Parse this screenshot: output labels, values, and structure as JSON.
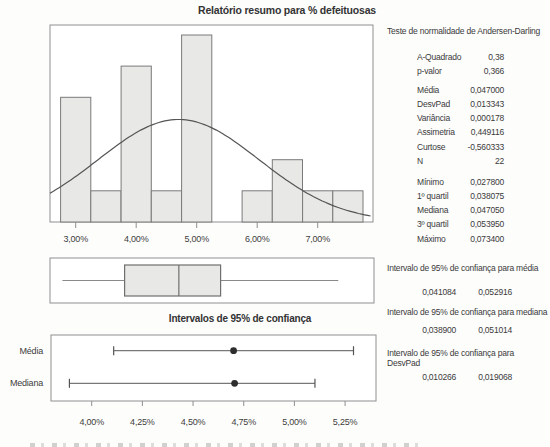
{
  "title": "Relatório resumo para % defeituosas",
  "colors": {
    "text": "#3b3b3b",
    "frame": "#8f8f8f",
    "bar_fill": "#e8e8e6",
    "bar_stroke": "#7a7a7a",
    "curve": "#555555",
    "box_fill": "#e8e8e6",
    "box_stroke": "#6f6f6f",
    "whisker": "#8a8a8a",
    "interval_line": "#777777",
    "interval_cap": "#555555",
    "point": "#2d2d2d"
  },
  "chart_data": [
    {
      "id": "histogram",
      "type": "bar",
      "title": "",
      "bins": [
        3.0,
        3.5,
        4.0,
        4.5,
        5.0,
        5.5,
        6.0,
        6.5,
        7.0,
        7.5
      ],
      "counts": [
        4,
        1,
        5,
        1,
        6,
        0,
        1,
        2,
        1,
        1
      ],
      "bin_width": 0.5,
      "x_ticks": [
        {
          "value": 3,
          "label": "3,00%"
        },
        {
          "value": 4,
          "label": "4,00%"
        },
        {
          "value": 5,
          "label": "5,00%"
        },
        {
          "value": 6,
          "label": "6,00%"
        },
        {
          "value": 7,
          "label": "7,00%"
        }
      ],
      "normal_overlay": {
        "mean": 4.7,
        "sd": 1.3343,
        "n": 22
      },
      "xlim": [
        2.575,
        7.91
      ],
      "ylim": [
        0,
        6.32
      ],
      "grid": false
    },
    {
      "id": "boxplot",
      "type": "boxplot",
      "min": 2.78,
      "q1": 3.8075,
      "median": 4.705,
      "q3": 5.395,
      "max": 7.34,
      "units": "percent"
    },
    {
      "id": "intervals",
      "type": "interval",
      "title": "Intervalos de 95% de confiança",
      "rows": [
        {
          "label": "Média",
          "low": 4.1084,
          "point": 4.7,
          "high": 5.2916
        },
        {
          "label": "Mediana",
          "low": 3.89,
          "point": 4.705,
          "high": 5.1014
        }
      ],
      "x_ticks": [
        {
          "value": 4.0,
          "label": "4,00%"
        },
        {
          "value": 4.25,
          "label": "4,25%"
        },
        {
          "value": 4.5,
          "label": "4,50%"
        },
        {
          "value": 4.75,
          "label": "4,75%"
        },
        {
          "value": 5.0,
          "label": "5,00%"
        },
        {
          "value": 5.25,
          "label": "5,25%"
        }
      ],
      "xlim": [
        3.8,
        5.6
      ]
    }
  ],
  "stats_panel": {
    "normality_header": "Teste de normalidade de Andersen-Darling",
    "groups": [
      {
        "rows": [
          [
            "A-Quadrado",
            "0,38"
          ],
          [
            "p-valor",
            "0,366"
          ]
        ]
      },
      {
        "rows": [
          [
            "Média",
            "0,047000"
          ],
          [
            "DesvPad",
            "0,013343"
          ],
          [
            "Variância",
            "0,000178"
          ],
          [
            "Assimetria",
            "0,449116"
          ],
          [
            "Curtose",
            "-0,560333"
          ],
          [
            "N",
            "22"
          ]
        ]
      },
      {
        "rows": [
          [
            "Mínimo",
            "0,027800"
          ],
          [
            "1º quartil",
            "0,038075"
          ],
          [
            "Mediana",
            "0,047050"
          ],
          [
            "3º quartil",
            "0,053950"
          ],
          [
            "Máximo",
            "0,073400"
          ]
        ]
      }
    ],
    "ci_sections": [
      {
        "header": "Intervalo de 95% de confiança para média",
        "low": "0,041084",
        "high": "0,052916"
      },
      {
        "header": "Intervalo de 95% de confiança para mediana",
        "low": "0,038900",
        "high": "0,051014"
      },
      {
        "header": "Intervalo de 95% de confiança para DesvPad",
        "low": "0,010266",
        "high": "0,019068"
      }
    ]
  }
}
